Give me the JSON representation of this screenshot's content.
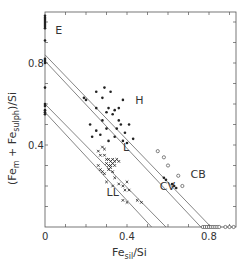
{
  "chart_data": {
    "type": "scatter",
    "title": "",
    "xlabel": "Fe_sil/Si",
    "ylabel": "(Fe_m + Fe_sulph)/Si",
    "xlabel_parts": {
      "main": "Fe",
      "sub": "sil",
      "tail": "/Si"
    },
    "ylabel_parts": {
      "open": "(Fe",
      "sub1": "m",
      "mid": " + Fe",
      "sub2": "sulph",
      "tail": ")/Si"
    },
    "xlim": [
      0,
      0.93
    ],
    "ylim": [
      0,
      1.05
    ],
    "x_tick_labels": [
      {
        "value": 0,
        "label": "0"
      },
      {
        "value": 0.4,
        "label": "0.4"
      },
      {
        "value": 0.8,
        "label": "0.8"
      }
    ],
    "y_tick_labels": [
      {
        "value": 0.4,
        "label": "0.4"
      },
      {
        "value": 0.8,
        "label": "0.8"
      }
    ],
    "minor_tick_step": 0.1,
    "grid": false,
    "legend": null,
    "group_labels": [
      {
        "text": "E",
        "x": 0.05,
        "y": 0.94
      },
      {
        "text": "H",
        "x": 0.44,
        "y": 0.6
      },
      {
        "text": "L",
        "x": 0.38,
        "y": 0.37
      },
      {
        "text": "LL",
        "x": 0.3,
        "y": 0.15
      },
      {
        "text": "CV",
        "x": 0.56,
        "y": 0.18
      },
      {
        "text": "CB",
        "x": 0.71,
        "y": 0.24
      }
    ],
    "reference_lines": [
      {
        "x0": 0,
        "y0": 0.84,
        "x1": 0.81,
        "y1": 0
      },
      {
        "x0": 0,
        "y0": 0.81,
        "x1": 0.76,
        "y1": 0
      },
      {
        "x0": 0,
        "y0": 0.6,
        "x1": 0.59,
        "y1": 0
      },
      {
        "x0": 0,
        "y0": 0.56,
        "x1": 0.52,
        "y1": 0
      }
    ],
    "series": [
      {
        "name": "E",
        "marker": "filled-circle",
        "points": [
          [
            0,
            1.03
          ],
          [
            0,
            1.02
          ],
          [
            0,
            1.01
          ],
          [
            0,
            1.0
          ],
          [
            0,
            0.99
          ],
          [
            0,
            0.98
          ],
          [
            0,
            0.97
          ],
          [
            0,
            0.91
          ],
          [
            0,
            0.82
          ],
          [
            0,
            0.81
          ],
          [
            0,
            0.8
          ],
          [
            0,
            0.68
          ],
          [
            0,
            0.6
          ],
          [
            0,
            0.59
          ],
          [
            0,
            0.57
          ],
          [
            0,
            0.56
          ],
          [
            0,
            0.55
          ]
        ]
      },
      {
        "name": "H",
        "marker": "filled-circle",
        "points": [
          [
            0.19,
            0.63
          ],
          [
            0.2,
            0.62
          ],
          [
            0.25,
            0.58
          ],
          [
            0.25,
            0.66
          ],
          [
            0.28,
            0.63
          ],
          [
            0.29,
            0.68
          ],
          [
            0.32,
            0.66
          ],
          [
            0.3,
            0.56
          ],
          [
            0.31,
            0.58
          ],
          [
            0.33,
            0.55
          ],
          [
            0.34,
            0.57
          ],
          [
            0.36,
            0.58
          ],
          [
            0.38,
            0.62
          ],
          [
            0.36,
            0.52
          ],
          [
            0.37,
            0.5
          ],
          [
            0.35,
            0.48
          ],
          [
            0.39,
            0.46
          ],
          [
            0.41,
            0.5
          ],
          [
            0.28,
            0.52
          ],
          [
            0.3,
            0.48
          ],
          [
            0.27,
            0.45
          ],
          [
            0.31,
            0.42
          ],
          [
            0.34,
            0.44
          ],
          [
            0.38,
            0.42
          ],
          [
            0.4,
            0.41
          ],
          [
            0.43,
            0.43
          ],
          [
            0.22,
            0.5
          ],
          [
            0.25,
            0.47
          ],
          [
            0.23,
            0.44
          ]
        ]
      },
      {
        "name": "L",
        "marker": "cross",
        "points": [
          [
            0.28,
            0.39
          ],
          [
            0.29,
            0.38
          ],
          [
            0.26,
            0.37
          ],
          [
            0.27,
            0.35
          ],
          [
            0.29,
            0.35
          ],
          [
            0.3,
            0.33
          ],
          [
            0.31,
            0.33
          ],
          [
            0.32,
            0.32
          ],
          [
            0.33,
            0.33
          ],
          [
            0.34,
            0.32
          ],
          [
            0.3,
            0.31
          ],
          [
            0.31,
            0.3
          ],
          [
            0.32,
            0.3
          ],
          [
            0.33,
            0.31
          ],
          [
            0.35,
            0.33
          ],
          [
            0.36,
            0.32
          ],
          [
            0.34,
            0.3
          ],
          [
            0.32,
            0.29
          ],
          [
            0.26,
            0.3
          ],
          [
            0.27,
            0.28
          ],
          [
            0.28,
            0.27
          ],
          [
            0.29,
            0.26
          ],
          [
            0.31,
            0.28
          ],
          [
            0.33,
            0.27
          ],
          [
            0.34,
            0.24
          ],
          [
            0.36,
            0.21
          ]
        ]
      },
      {
        "name": "LL",
        "marker": "cross",
        "points": [
          [
            0.3,
            0.22
          ],
          [
            0.33,
            0.2
          ],
          [
            0.38,
            0.2
          ],
          [
            0.4,
            0.22
          ],
          [
            0.39,
            0.18
          ],
          [
            0.41,
            0.18
          ],
          [
            0.38,
            0.13
          ],
          [
            0.4,
            0.12
          ],
          [
            0.45,
            0.13
          ],
          [
            0.47,
            0.12
          ]
        ]
      },
      {
        "name": "CV",
        "marker": "filled-circle",
        "points": [
          [
            0.58,
            0.24
          ],
          [
            0.59,
            0.23
          ],
          [
            0.62,
            0.21
          ],
          [
            0.63,
            0.2
          ],
          [
            0.64,
            0.19
          ]
        ]
      },
      {
        "name": "CB / C",
        "marker": "open-circle",
        "points": [
          [
            0.55,
            0.37
          ],
          [
            0.58,
            0.34
          ],
          [
            0.6,
            0.3
          ],
          [
            0.65,
            0.25
          ],
          [
            0.67,
            0.2
          ],
          [
            0.77,
            0.0
          ],
          [
            0.78,
            0.0
          ],
          [
            0.79,
            0.0
          ],
          [
            0.8,
            0.0
          ],
          [
            0.81,
            0.0
          ],
          [
            0.82,
            0.0
          ],
          [
            0.83,
            0.0
          ],
          [
            0.84,
            0.0
          ],
          [
            0.85,
            0.0
          ],
          [
            0.88,
            0.0
          ],
          [
            0.9,
            0.0
          ],
          [
            0.92,
            0.0
          ]
        ]
      }
    ]
  }
}
